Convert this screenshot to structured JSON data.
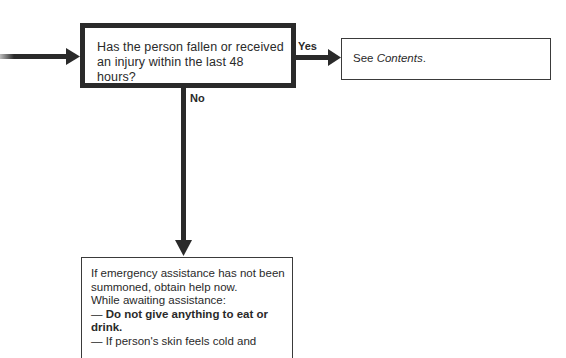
{
  "flowchart": {
    "question_box": {
      "text": "Has the person fallen or received an injury within the last 48 hours?"
    },
    "yes_branch": {
      "label": "Yes",
      "target": {
        "prefix": "See ",
        "italic": "Contents",
        "suffix": "."
      }
    },
    "no_branch": {
      "label": "No",
      "target": {
        "line1": "If emergency assistance has not been summoned, obtain help now.",
        "line2": "While awaiting assistance:",
        "bullet1_dash": "— ",
        "bullet1_bold": "Do not give anything to eat or drink.",
        "bullet2": "— If person's skin feels cold and"
      }
    }
  },
  "colors": {
    "ink": "#2a2a2a",
    "background": "#ffffff"
  }
}
